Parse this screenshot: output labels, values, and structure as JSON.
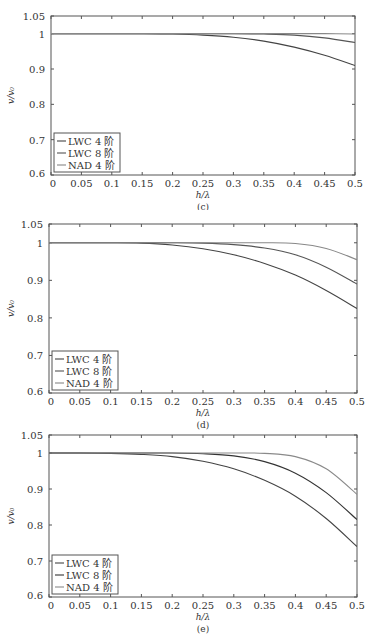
{
  "chart_data": [
    {
      "type": "line",
      "panel": "(c)",
      "caption": "(c)",
      "xlabel": "h/λ",
      "ylabel": "v/v₀",
      "xlim": [
        0,
        0.5
      ],
      "ylim": [
        0.6,
        1.05
      ],
      "xticks": [
        "0",
        "0.05",
        "0.1",
        "0.15",
        "0.2",
        "0.25",
        "0.3",
        "0.35",
        "0.4",
        "0.45",
        "0.5"
      ],
      "yticks": [
        "0.6",
        "0.7",
        "0.8",
        "0.9",
        "1",
        "1.05"
      ],
      "grid": false,
      "legend_position": "lower left",
      "x": [
        0,
        0.05,
        0.1,
        0.15,
        0.2,
        0.25,
        0.3,
        0.35,
        0.4,
        0.45,
        0.5
      ],
      "series": [
        {
          "name": "LWC 4 阶",
          "color": "#444444",
          "values": [
            1.0,
            1.0,
            1.0,
            1.0,
            0.999,
            0.996,
            0.99,
            0.979,
            0.962,
            0.939,
            0.91
          ]
        },
        {
          "name": "LWC 8 阶",
          "color": "#555555",
          "values": [
            1.0,
            1.0,
            1.0,
            1.0,
            1.0,
            1.0,
            1.0,
            0.999,
            0.996,
            0.988,
            0.975
          ]
        },
        {
          "name": "NAD 4 阶",
          "color": "#888888",
          "values": [
            1.0,
            1.0,
            1.0,
            1.0,
            1.0,
            1.0,
            1.0,
            1.0,
            1.0,
            1.0,
            0.999
          ]
        }
      ]
    },
    {
      "type": "line",
      "panel": "(d)",
      "caption": "(d)",
      "xlabel": "h/λ",
      "ylabel": "v/v₀",
      "xlim": [
        0,
        0.5
      ],
      "ylim": [
        0.6,
        1.05
      ],
      "xticks": [
        "0",
        "0.05",
        "0.1",
        "0.15",
        "0.2",
        "0.25",
        "0.3",
        "0.35",
        "0.4",
        "0.45",
        "0.5"
      ],
      "yticks": [
        "0.6",
        "0.7",
        "0.8",
        "0.9",
        "1",
        "1.05"
      ],
      "grid": false,
      "legend_position": "lower left",
      "x": [
        0,
        0.05,
        0.1,
        0.15,
        0.2,
        0.25,
        0.3,
        0.35,
        0.4,
        0.45,
        0.5
      ],
      "series": [
        {
          "name": "LWC 4 阶",
          "color": "#444444",
          "values": [
            1.0,
            1.0,
            1.0,
            0.999,
            0.994,
            0.984,
            0.968,
            0.945,
            0.914,
            0.873,
            0.825
          ]
        },
        {
          "name": "LWC 8 阶",
          "color": "#555555",
          "values": [
            1.0,
            1.0,
            1.0,
            1.0,
            1.0,
            0.999,
            0.995,
            0.986,
            0.968,
            0.935,
            0.89
          ]
        },
        {
          "name": "NAD 4 阶",
          "color": "#888888",
          "values": [
            1.0,
            1.0,
            1.0,
            1.0,
            1.0,
            1.0,
            1.0,
            1.0,
            0.998,
            0.985,
            0.955
          ]
        }
      ]
    },
    {
      "type": "line",
      "panel": "(e)",
      "caption": "(e)",
      "xlabel": "h/λ",
      "ylabel": "v/v₀",
      "xlim": [
        0,
        0.5
      ],
      "ylim": [
        0.6,
        1.05
      ],
      "xticks": [
        "0",
        "0.05",
        "0.1",
        "0.15",
        "0.2",
        "0.25",
        "0.3",
        "0.35",
        "0.4",
        "0.45",
        "0.5"
      ],
      "yticks": [
        "0.6",
        "0.7",
        "0.8",
        "0.9",
        "1",
        "1.05"
      ],
      "grid": false,
      "legend_position": "lower left",
      "x": [
        0,
        0.05,
        0.1,
        0.15,
        0.2,
        0.25,
        0.3,
        0.35,
        0.4,
        0.45,
        0.5
      ],
      "series": [
        {
          "name": "LWC 4 阶",
          "color": "#444444",
          "values": [
            1.0,
            1.0,
            0.999,
            0.996,
            0.99,
            0.977,
            0.956,
            0.924,
            0.88,
            0.818,
            0.74
          ]
        },
        {
          "name": "LWC 8 阶",
          "color": "#333333",
          "values": [
            1.0,
            1.0,
            1.0,
            1.0,
            1.0,
            0.998,
            0.992,
            0.976,
            0.944,
            0.89,
            0.815
          ]
        },
        {
          "name": "NAD 4 阶",
          "color": "#8a8a8a",
          "values": [
            1.0,
            1.0,
            1.0,
            1.0,
            1.0,
            1.0,
            1.0,
            0.999,
            0.99,
            0.956,
            0.885
          ]
        }
      ]
    }
  ],
  "panels": [
    {
      "caption": "(c)",
      "xlabel": "h/λ",
      "ylabel": "v/v₀"
    },
    {
      "caption": "(d)",
      "xlabel": "h/λ",
      "ylabel": "v/v₀"
    },
    {
      "caption": "(e)",
      "xlabel": "h/λ",
      "ylabel": "v/v₀"
    }
  ]
}
